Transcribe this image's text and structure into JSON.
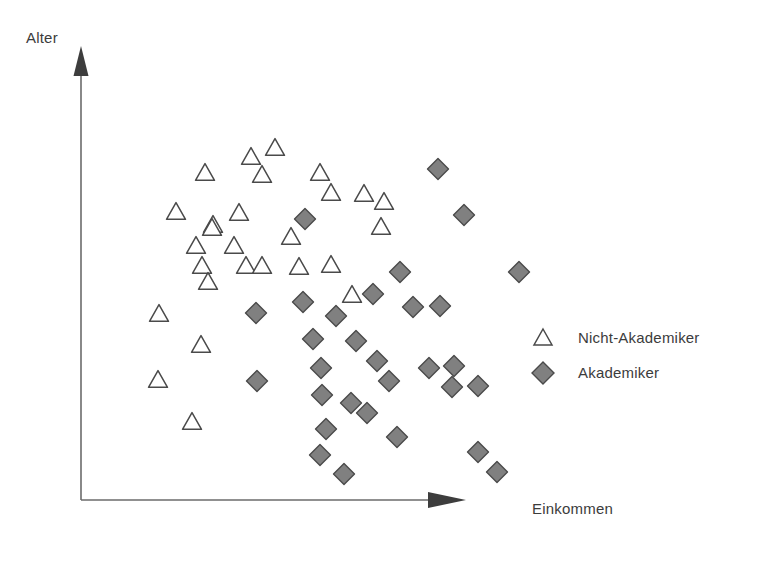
{
  "chart_data": {
    "type": "scatter",
    "title": "",
    "subtitle": "",
    "xlabel": "Einkommen",
    "ylabel": "Alter",
    "grid": false,
    "axes_style": "arrow-axes-no-ticks",
    "xlim": [
      0,
      100
    ],
    "ylim": [
      0,
      100
    ],
    "xticks": [],
    "yticks": [],
    "legend_position": "center-right",
    "colors": {
      "akademiker_fill": "#808080",
      "akademiker_stroke": "#4a4a4a",
      "nicht_akademiker_fill": "#ffffff",
      "nicht_akademiker_stroke": "#4a4a4a",
      "axis": "#606060",
      "text": "#3c3c3c",
      "background": "#ffffff"
    },
    "series": [
      {
        "name": "Nicht-Akademiker",
        "marker": "triangle",
        "count": 28,
        "points": [
          [
            52.8,
            80.3
          ],
          [
            63.1,
            83.6
          ],
          [
            31.3,
            74.2
          ],
          [
            67.6,
            76.3
          ],
          [
            22.0,
            69.5
          ],
          [
            46.9,
            72.4
          ],
          [
            75.0,
            69.0
          ],
          [
            87.3,
            75.1
          ],
          [
            41.8,
            66.2
          ],
          [
            110.5,
            71.7
          ],
          [
            34.4,
            62.1
          ],
          [
            93.6,
            63.2
          ],
          [
            26.9,
            57.4
          ],
          [
            59.1,
            58.9
          ],
          [
            48.0,
            53.3
          ],
          [
            18.6,
            50.2
          ],
          [
            41.0,
            48.6
          ],
          [
            38.0,
            44.8
          ],
          [
            62.8,
            47.2
          ],
          [
            82.0,
            49.1
          ],
          [
            8.2,
            40.6
          ],
          [
            26.0,
            34.7
          ],
          [
            7.9,
            25.3
          ],
          [
            21.7,
            17.5
          ]
        ]
      },
      {
        "name": "Akademiker",
        "marker": "diamond",
        "count": 45,
        "points": [
          [
            114.9,
            82.2
          ],
          [
            70.3,
            64.0
          ],
          [
            124.3,
            65.6
          ],
          [
            98.9,
            50.1
          ],
          [
            151.6,
            50.5
          ],
          [
            87.2,
            45.9
          ],
          [
            104.5,
            43.9
          ],
          [
            114.6,
            43.5
          ],
          [
            64.2,
            44.5
          ],
          [
            44.6,
            40.9
          ],
          [
            74.8,
            39.4
          ],
          [
            66.5,
            32.6
          ],
          [
            83.1,
            32.1
          ],
          [
            91.2,
            26.9
          ],
          [
            64.4,
            24.3
          ],
          [
            112.1,
            25.4
          ],
          [
            121.3,
            25.0
          ],
          [
            95.7,
            21.2
          ],
          [
            120.4,
            20.0
          ],
          [
            130.6,
            20.5
          ],
          [
            45.0,
            23.3
          ],
          [
            71.3,
            20.8
          ],
          [
            81.8,
            15.0
          ],
          [
            90.2,
            17.3
          ],
          [
            72.3,
            11.2
          ],
          [
            98.3,
            9.5
          ],
          [
            69.8,
            4.8
          ],
          [
            79.3,
            1.9
          ],
          [
            133.0,
            5.6
          ],
          [
            140.5,
            1.4
          ]
        ]
      }
    ]
  },
  "markers": {
    "triangles": [
      {
        "x": 251,
        "y": 156
      },
      {
        "x": 275,
        "y": 147
      },
      {
        "x": 205,
        "y": 172
      },
      {
        "x": 262,
        "y": 174
      },
      {
        "x": 320,
        "y": 172
      },
      {
        "x": 176,
        "y": 211
      },
      {
        "x": 239,
        "y": 212
      },
      {
        "x": 331,
        "y": 192
      },
      {
        "x": 364,
        "y": 193
      },
      {
        "x": 213,
        "y": 224
      },
      {
        "x": 384,
        "y": 201
      },
      {
        "x": 212,
        "y": 227
      },
      {
        "x": 291,
        "y": 236
      },
      {
        "x": 381,
        "y": 226
      },
      {
        "x": 196,
        "y": 245
      },
      {
        "x": 234,
        "y": 245
      },
      {
        "x": 246,
        "y": 265
      },
      {
        "x": 262,
        "y": 265
      },
      {
        "x": 202,
        "y": 265
      },
      {
        "x": 299,
        "y": 266
      },
      {
        "x": 331,
        "y": 264
      },
      {
        "x": 208,
        "y": 281
      },
      {
        "x": 159,
        "y": 313
      },
      {
        "x": 352,
        "y": 294
      },
      {
        "x": 201,
        "y": 344
      },
      {
        "x": 158,
        "y": 379
      },
      {
        "x": 192,
        "y": 421
      }
    ],
    "diamonds": [
      {
        "x": 438,
        "y": 169
      },
      {
        "x": 305,
        "y": 219
      },
      {
        "x": 464,
        "y": 215
      },
      {
        "x": 400,
        "y": 272
      },
      {
        "x": 519,
        "y": 272
      },
      {
        "x": 373,
        "y": 294
      },
      {
        "x": 413,
        "y": 307
      },
      {
        "x": 440,
        "y": 306
      },
      {
        "x": 303,
        "y": 302
      },
      {
        "x": 256,
        "y": 313
      },
      {
        "x": 336,
        "y": 316
      },
      {
        "x": 313,
        "y": 339
      },
      {
        "x": 356,
        "y": 341
      },
      {
        "x": 377,
        "y": 361
      },
      {
        "x": 321,
        "y": 368
      },
      {
        "x": 429,
        "y": 368
      },
      {
        "x": 454,
        "y": 366
      },
      {
        "x": 389,
        "y": 381
      },
      {
        "x": 452,
        "y": 387
      },
      {
        "x": 478,
        "y": 386
      },
      {
        "x": 257,
        "y": 381
      },
      {
        "x": 322,
        "y": 395
      },
      {
        "x": 351,
        "y": 403
      },
      {
        "x": 367,
        "y": 413
      },
      {
        "x": 326,
        "y": 429
      },
      {
        "x": 397,
        "y": 437
      },
      {
        "x": 320,
        "y": 455
      },
      {
        "x": 344,
        "y": 474
      },
      {
        "x": 478,
        "y": 452
      },
      {
        "x": 497,
        "y": 472
      }
    ]
  },
  "axes": {
    "y_axis_label": "Alter",
    "x_axis_label": "Einkommen",
    "origin": {
      "x": 81,
      "y": 500
    },
    "y_axis_top": {
      "x": 81,
      "y": 48
    },
    "x_axis_right": {
      "x": 465,
      "y": 500
    }
  },
  "legend": {
    "items": [
      {
        "label": "Nicht-Akademiker",
        "marker": "triangle"
      },
      {
        "label": "Akademiker",
        "marker": "diamond"
      }
    ]
  }
}
